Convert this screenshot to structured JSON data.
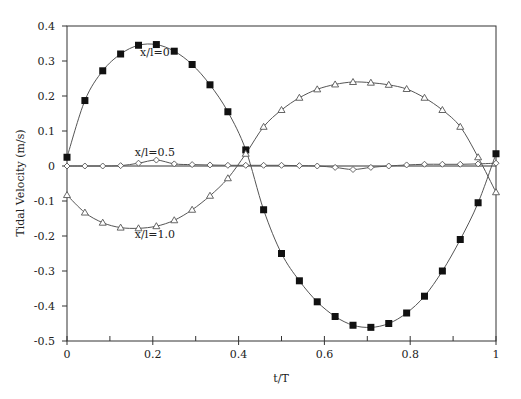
{
  "chart_data": {
    "type": "line",
    "title": "",
    "xlabel": "t/T",
    "ylabel": "Tidal Velocity (m/s)",
    "xlim": [
      0,
      1
    ],
    "ylim": [
      -0.5,
      0.4
    ],
    "xticks": [
      0,
      0.2,
      0.4,
      0.6,
      0.8,
      1
    ],
    "xtick_labels": [
      "0",
      "0.2",
      "0.4",
      "0.6",
      "0.8",
      "1"
    ],
    "xminor_ticks": [
      0.1,
      0.3,
      0.5,
      0.7,
      0.9
    ],
    "yticks": [
      0.4,
      0.3,
      0.2,
      0.1,
      0,
      -0.1,
      -0.2,
      -0.3,
      -0.4,
      -0.5
    ],
    "ytick_labels": [
      "0.4",
      "0.3",
      "0.2",
      "0.1",
      "0",
      "-0.1",
      "-0.2",
      "-0.3",
      "-0.4",
      "-0.5"
    ],
    "grid": false,
    "zero_line": true,
    "legend": "inline labels",
    "x": [
      0,
      0.0417,
      0.0833,
      0.125,
      0.1667,
      0.2083,
      0.25,
      0.2917,
      0.3333,
      0.375,
      0.4167,
      0.4583,
      0.5,
      0.5417,
      0.5833,
      0.625,
      0.6667,
      0.7083,
      0.75,
      0.7917,
      0.8333,
      0.875,
      0.9167,
      0.9583,
      1.0
    ],
    "series": [
      {
        "name": "x/l=0",
        "marker": "filled-square",
        "values": [
          0.025,
          0.187,
          0.272,
          0.32,
          0.345,
          0.347,
          0.328,
          0.29,
          0.232,
          0.155,
          0.046,
          -0.125,
          -0.25,
          -0.328,
          -0.388,
          -0.43,
          -0.455,
          -0.461,
          -0.45,
          -0.42,
          -0.372,
          -0.3,
          -0.21,
          -0.105,
          0.035
        ]
      },
      {
        "name": "x/l=0.5",
        "marker": "open-diamond",
        "values": [
          0.0,
          0.0,
          0.0,
          0.001,
          0.008,
          0.017,
          0.006,
          0.004,
          0.003,
          0.002,
          0.002,
          0.002,
          0.002,
          0.001,
          0.0,
          -0.004,
          -0.01,
          -0.004,
          0.0,
          0.003,
          0.005,
          0.005,
          0.005,
          0.006,
          0.008
        ]
      },
      {
        "name": "x/l=1.0",
        "marker": "open-triangle",
        "values": [
          -0.083,
          -0.133,
          -0.162,
          -0.176,
          -0.178,
          -0.172,
          -0.155,
          -0.125,
          -0.085,
          -0.035,
          0.035,
          0.112,
          0.16,
          0.195,
          0.219,
          0.233,
          0.24,
          0.238,
          0.232,
          0.22,
          0.195,
          0.16,
          0.112,
          0.025,
          -0.075
        ]
      }
    ],
    "annotations": [
      {
        "text": "x/l=0",
        "x": 0.205,
        "y": 0.315
      },
      {
        "text": "x/l=0.5",
        "x": 0.205,
        "y": 0.03
      },
      {
        "text": "x/l=1.0",
        "x": 0.205,
        "y": -0.205
      }
    ]
  },
  "colors": {
    "axis": "#333333",
    "line": "#555555",
    "marker_fill": "#111111",
    "background": "#ffffff"
  }
}
